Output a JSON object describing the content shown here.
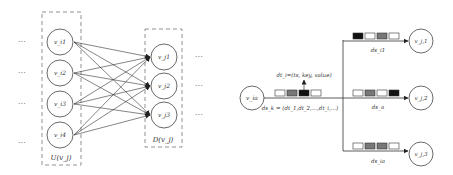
{
  "left_diagram": {
    "upstream_group": {
      "label": "U(v_j)",
      "nodes": [
        "v_i1",
        "v_i2",
        "v_i3",
        "v_i4"
      ]
    },
    "downstream_group": {
      "label": "D(v_j)",
      "nodes": [
        "v_j1",
        "v_j2",
        "v_j3"
      ]
    },
    "ellipsis": "···",
    "edges": "fully-connected upstream → downstream (arrows)"
  },
  "right_diagram": {
    "source_node": "v_ia",
    "tuple_label": "dt_i=(ts, key, value)",
    "stream_label": "ds_k = (dt_1,dt_2,...,dt_i,...)",
    "source_queue": [
      "white",
      "gray",
      "black",
      "white"
    ],
    "branches": [
      {
        "target_node": "v_j,1",
        "stream_label": "ds_i1",
        "queue": [
          "black",
          "white",
          "gray",
          "white"
        ]
      },
      {
        "target_node": "v_j,2",
        "stream_label": "ds_a",
        "queue": [
          "white",
          "gray",
          "white",
          "black"
        ]
      },
      {
        "target_node": "v_j,3",
        "stream_label": "ds_ia",
        "queue": [
          "white",
          "gray",
          "gray",
          "white"
        ]
      }
    ]
  },
  "colors": {
    "line": "#444444",
    "dash": "#777777",
    "black_cell": "#111111",
    "gray_cell": "#777777",
    "white_cell": "#ffffff"
  }
}
